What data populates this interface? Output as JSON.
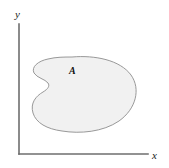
{
  "figure": {
    "background_color": "#ffffff"
  },
  "axes": {
    "x_label": "x",
    "y_label": "y",
    "axis_color": "#6e6e6e",
    "origin_x": 19,
    "origin_y": 154,
    "y_axis_top": 24,
    "x_axis_right": 148
  },
  "region": {
    "label": "A",
    "fill_color": "#f1f1f1",
    "stroke_color": "#8d8d8d",
    "label_color": "#101010",
    "path": "M 72 57 C 95 55, 120 60, 131 75 C 141 89, 136 109, 119 121 C 103 132, 80 134, 62 131 C 47 129, 36 123, 33 113 C 30 103, 36 96, 43 92 C 48 89, 50 86, 48 83 C 45 79, 37 78, 34 73 C 31 67, 38 61, 48 59 C 56 57, 64 57, 72 57 Z"
  }
}
